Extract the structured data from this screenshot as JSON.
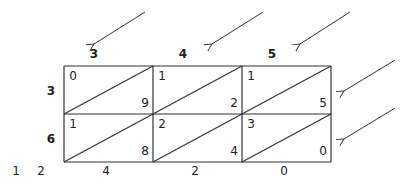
{
  "diagram": {
    "top_digits": [
      "3",
      "4",
      "5"
    ],
    "left_digits": [
      "3",
      "6"
    ],
    "cells": [
      [
        {
          "tens": "0",
          "units": "9"
        },
        {
          "tens": "1",
          "units": "2"
        },
        {
          "tens": "1",
          "units": "5"
        }
      ],
      [
        {
          "tens": "1",
          "units": "8"
        },
        {
          "tens": "2",
          "units": "4"
        },
        {
          "tens": "3",
          "units": "0"
        }
      ]
    ],
    "result_left": [
      "1",
      "2"
    ],
    "result_bottom": [
      "4",
      "2",
      "0"
    ],
    "colors": {
      "line": "#333333",
      "text": "#222222"
    }
  }
}
